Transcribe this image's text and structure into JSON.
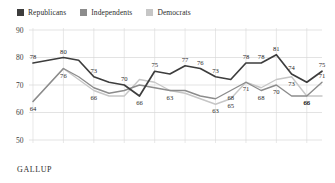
{
  "legend": {
    "position": "top-left",
    "items": [
      {
        "label": "Republicans",
        "color": "#3d3d3d",
        "icon": "square-swatch"
      },
      {
        "label": "Independents",
        "color": "#8c8c8c",
        "icon": "square-swatch"
      },
      {
        "label": "Democrats",
        "color": "#c6c6c6",
        "icon": "square-swatch"
      }
    ]
  },
  "source": {
    "label": "GALLUP"
  },
  "chart_data": {
    "type": "line",
    "title": "",
    "subtitle": "",
    "xlabel": "",
    "ylabel": "",
    "ylim": [
      50,
      90
    ],
    "yticks": [
      50,
      60,
      70,
      80,
      90
    ],
    "xlim": [
      1998,
      2017
    ],
    "xticks": [
      1998,
      2000,
      2002,
      2004,
      2006,
      2008,
      2010,
      2012,
      2014,
      2016
    ],
    "grid": true,
    "x": [
      1998,
      1999,
      2000,
      2001,
      2002,
      2003,
      2004,
      2005,
      2006,
      2007,
      2008,
      2009,
      2010,
      2011,
      2012,
      2013,
      2014,
      2015,
      2016,
      2017
    ],
    "series": [
      {
        "name": "Republicans",
        "color": "#3d3d3d",
        "values": [
          78,
          79,
          80,
          79,
          73,
          71,
          70,
          66,
          75,
          74,
          77,
          76,
          73,
          72,
          78,
          78,
          81,
          74,
          71,
          75
        ],
        "labels": [
          {
            "x": 1998,
            "y": 78,
            "text": "78",
            "pos": "above"
          },
          {
            "x": 2000,
            "y": 80,
            "text": "80",
            "pos": "above"
          },
          {
            "x": 2002,
            "y": 73,
            "text": "73",
            "pos": "above"
          },
          {
            "x": 2004,
            "y": 70,
            "text": "70",
            "pos": "above"
          },
          {
            "x": 2005,
            "y": 66,
            "text": "66",
            "pos": "below"
          },
          {
            "x": 2006,
            "y": 75,
            "text": "75",
            "pos": "above"
          },
          {
            "x": 2008,
            "y": 77,
            "text": "77",
            "pos": "above"
          },
          {
            "x": 2009,
            "y": 76,
            "text": "76",
            "pos": "above"
          },
          {
            "x": 2010,
            "y": 73,
            "text": "73",
            "pos": "above"
          },
          {
            "x": 2012,
            "y": 78,
            "text": "78",
            "pos": "above"
          },
          {
            "x": 2013,
            "y": 78,
            "text": "78",
            "pos": "above"
          },
          {
            "x": 2014,
            "y": 81,
            "text": "81",
            "pos": "above"
          },
          {
            "x": 2015,
            "y": 74,
            "text": "74",
            "pos": "above"
          },
          {
            "x": 2017,
            "y": 75,
            "text": "75",
            "pos": "above"
          }
        ]
      },
      {
        "name": "Independents",
        "color": "#8c8c8c",
        "values": [
          64,
          70,
          76,
          73,
          69,
          67,
          68,
          70,
          69,
          68,
          68,
          66,
          65,
          68,
          71,
          68,
          70,
          66,
          66,
          71
        ],
        "labels": [
          {
            "x": 2011,
            "y": 68,
            "text": "68",
            "pos": "below"
          },
          {
            "x": 2012,
            "y": 71,
            "text": "71",
            "pos": "below"
          },
          {
            "x": 2013,
            "y": 68,
            "text": "68",
            "pos": "below"
          },
          {
            "x": 2014,
            "y": 70,
            "text": "70",
            "pos": "below"
          },
          {
            "x": 2016,
            "y": 66,
            "text": "66",
            "pos": "below"
          },
          {
            "x": 2017,
            "y": 71,
            "text": "71",
            "pos": "above"
          }
        ]
      },
      {
        "name": "Democrats",
        "color": "#c6c6c6",
        "values": [
          64,
          70,
          76,
          72,
          68,
          66,
          66,
          72,
          71,
          68,
          67,
          65,
          63,
          65,
          71,
          69,
          72,
          73,
          66,
          66
        ],
        "labels": [
          {
            "x": 1998,
            "y": 64,
            "text": "64",
            "pos": "below"
          },
          {
            "x": 2000,
            "y": 76,
            "text": "76",
            "pos": "below"
          },
          {
            "x": 2002,
            "y": 68,
            "text": "66",
            "pos": "below"
          },
          {
            "x": 2007,
            "y": 68,
            "text": "63",
            "pos": "below"
          },
          {
            "x": 2010,
            "y": 63,
            "text": "63",
            "pos": "below"
          },
          {
            "x": 2011,
            "y": 65,
            "text": "65",
            "pos": "below"
          },
          {
            "x": 2015,
            "y": 73,
            "text": "73",
            "pos": "below"
          },
          {
            "x": 2016,
            "y": 66,
            "text": "66",
            "pos": "below"
          }
        ]
      }
    ]
  }
}
